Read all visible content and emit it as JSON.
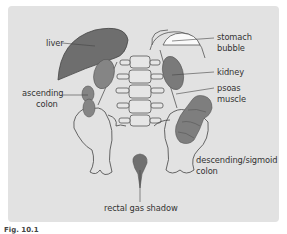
{
  "figure": {
    "caption": "Fig. 10.1",
    "panel_color": "#e2e2e2",
    "organ_dark_color": "#6b6b6b",
    "organ_mid_color": "#858585",
    "outline_color": "#4a4a4a"
  },
  "labels": {
    "liver": "liver",
    "stomach_line1": "stomach",
    "stomach_line2": "bubble",
    "kidney": "kidney",
    "psoas_line1": "psoas",
    "psoas_line2": "muscle",
    "ascending_line1": "ascending",
    "ascending_line2": "colon",
    "descending_line1": "descending/sigmoid",
    "descending_line2": "colon",
    "rectal": "rectal gas shadow"
  }
}
